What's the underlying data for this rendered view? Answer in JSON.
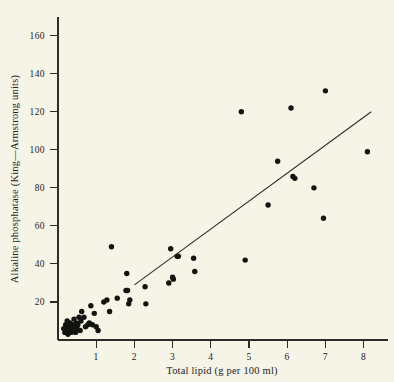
{
  "chart_data": {
    "type": "scatter",
    "title": "",
    "xlabel": "Total lipid (g per 100 ml)",
    "ylabel": "Alkaline phosphatase (King—Armstrong units)",
    "xlim": [
      0,
      8.6
    ],
    "ylim": [
      0,
      168
    ],
    "xticks": [
      1,
      2,
      3,
      4,
      5,
      6,
      7,
      8
    ],
    "xtick_labels": [
      "1",
      "2",
      "3",
      "4",
      "5",
      "6",
      "7",
      "8"
    ],
    "yticks": [
      20,
      40,
      60,
      80,
      100,
      120,
      140,
      160
    ],
    "ytick_labels": [
      "20",
      "40",
      "60",
      "80",
      "100",
      "120",
      "140",
      "160"
    ],
    "grid": false,
    "legend": false,
    "marker": "filled-circle",
    "marker_color": "#131311",
    "axis_color": "#2b2b28",
    "background_color": "#f6f3e7",
    "points": [
      [
        0.15,
        6
      ],
      [
        0.18,
        4
      ],
      [
        0.2,
        8
      ],
      [
        0.22,
        5
      ],
      [
        0.24,
        10
      ],
      [
        0.26,
        3
      ],
      [
        0.28,
        7
      ],
      [
        0.3,
        5
      ],
      [
        0.32,
        9
      ],
      [
        0.34,
        4
      ],
      [
        0.36,
        6
      ],
      [
        0.38,
        8
      ],
      [
        0.4,
        5
      ],
      [
        0.42,
        11
      ],
      [
        0.44,
        7
      ],
      [
        0.46,
        4
      ],
      [
        0.48,
        9
      ],
      [
        0.5,
        6
      ],
      [
        0.52,
        8
      ],
      [
        0.55,
        12
      ],
      [
        0.58,
        5
      ],
      [
        0.6,
        10
      ],
      [
        0.62,
        15
      ],
      [
        0.68,
        12
      ],
      [
        0.72,
        7
      ],
      [
        0.78,
        8
      ],
      [
        0.82,
        9
      ],
      [
        0.86,
        18
      ],
      [
        0.9,
        8
      ],
      [
        0.95,
        14
      ],
      [
        1.0,
        7
      ],
      [
        1.05,
        5
      ],
      [
        1.2,
        20
      ],
      [
        1.28,
        21
      ],
      [
        1.35,
        15
      ],
      [
        1.4,
        49
      ],
      [
        1.55,
        22
      ],
      [
        1.78,
        26
      ],
      [
        1.82,
        26
      ],
      [
        1.85,
        19
      ],
      [
        1.88,
        21
      ],
      [
        1.8,
        35
      ],
      [
        2.3,
        19
      ],
      [
        2.28,
        28
      ],
      [
        2.9,
        30
      ],
      [
        2.95,
        48
      ],
      [
        3.0,
        33
      ],
      [
        3.02,
        32
      ],
      [
        3.12,
        44
      ],
      [
        3.15,
        44
      ],
      [
        3.55,
        43
      ],
      [
        3.58,
        36
      ],
      [
        4.8,
        120
      ],
      [
        4.9,
        42
      ],
      [
        5.5,
        71
      ],
      [
        5.75,
        94
      ],
      [
        6.1,
        122
      ],
      [
        6.15,
        86
      ],
      [
        6.2,
        85
      ],
      [
        6.7,
        80
      ],
      [
        6.95,
        64
      ],
      [
        7.0,
        131
      ],
      [
        8.1,
        99
      ]
    ],
    "fit_line": {
      "label": "regression line",
      "x_start": 2.0,
      "y_start": 29,
      "x_end": 8.2,
      "y_end": 120
    }
  }
}
